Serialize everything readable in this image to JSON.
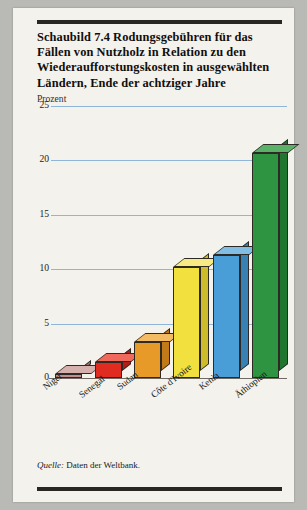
{
  "figure": {
    "title": "Schaubild 7.4   Rodungsgebühren für das Fällen von Nutzholz in Relation zu den Wiederaufforstungskosten in ausgewählten Ländern, Ende der achtziger Jahre",
    "source_prefix": "Quelle:",
    "source_text": " Daten der Weltbank."
  },
  "chart_data": {
    "type": "bar",
    "title": "Schaubild 7.4   Rodungsgebühren für das Fällen von Nutzholz in Relation zu den Wiederaufforstungskosten in ausgewählten Ländern, Ende der achtziger Jahre",
    "xlabel": "",
    "ylabel": "Prozent",
    "ylim": [
      0,
      25
    ],
    "yticks": [
      0,
      5,
      10,
      15,
      20,
      25
    ],
    "ytick_labels": [
      "0",
      "5",
      "10",
      "15",
      "20",
      "25"
    ],
    "grid": true,
    "legend": false,
    "categories": [
      "Niger",
      "Senegal",
      "Sudan",
      "Côte d'Ivoire",
      "Kenia",
      "Äthiopien"
    ],
    "values": [
      0.4,
      1.5,
      3.3,
      10.2,
      11.3,
      20.7
    ],
    "colors": [
      "#c08e8c",
      "#e02b20",
      "#e89a28",
      "#f2e03f",
      "#4a9ed8",
      "#2e9442"
    ],
    "side_colors": [
      "#a8706e",
      "#b41d15",
      "#c27a18",
      "#cdbb2c",
      "#3781b4",
      "#21762f"
    ],
    "top_colors": [
      "#d6b0ad",
      "#ef6a5c",
      "#f3bb63",
      "#f7ea84",
      "#82bee4",
      "#5cb168"
    ]
  }
}
